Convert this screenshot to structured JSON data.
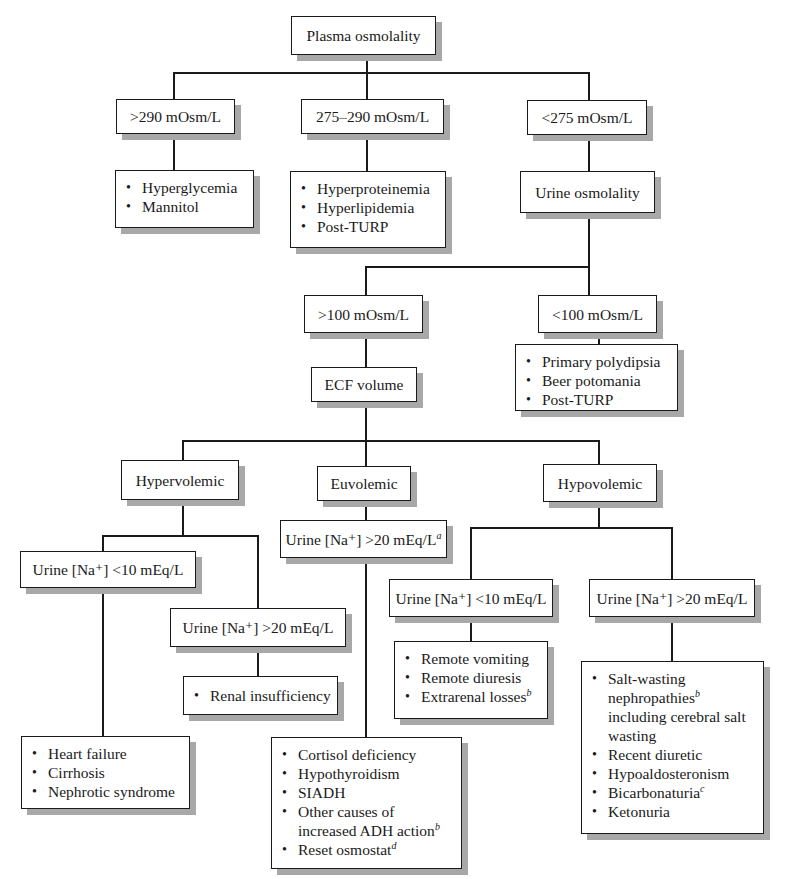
{
  "nodes": {
    "plasma_osmolality": "Plasma osmolality",
    "gt290": ">290 mOsm/L",
    "range275_290": "275–290 mOsm/L",
    "lt275": "<275 mOsm/L",
    "hyperglycemia_list": [
      "Hyperglycemia",
      "Mannitol"
    ],
    "hyperproteinemia_list": [
      "Hyperproteinemia",
      "Hyperlipidemia",
      "Post-TURP"
    ],
    "urine_osmolality": "Urine osmolality",
    "gt100": ">100 mOsm/L",
    "lt100": "<100 mOsm/L",
    "lt100_list": [
      "Primary polydipsia",
      "Beer potomania",
      "Post-TURP"
    ],
    "ecf_volume": "ECF volume",
    "hypervolemic": "Hypervolemic",
    "euvolemic": "Euvolemic",
    "hypovolemic": "Hypovolemic",
    "hyper_una_lt10": "Urine [Na⁺] <10 mEq/L",
    "hyper_una_gt20": "Urine [Na⁺] >20 mEq/L",
    "eu_una_gt20": {
      "text": "Urine [Na⁺] >20 mEq/L",
      "sup": "a"
    },
    "hypo_una_lt10": "Urine [Na⁺] <10 mEq/L",
    "hypo_una_gt20": "Urine [Na⁺] >20 mEq/L",
    "renal_list": [
      "Renal insufficiency"
    ],
    "heart_failure_list": [
      "Heart failure",
      "Cirrhosis",
      "Nephrotic syndrome"
    ],
    "euvolemic_list": [
      {
        "text": "Cortisol deficiency",
        "sup": ""
      },
      {
        "text": "Hypothyroidism",
        "sup": ""
      },
      {
        "text": "SIADH",
        "sup": ""
      },
      {
        "text": "Other causes of",
        "line2": "increased ADH action",
        "sup": "b"
      },
      {
        "text": "Reset osmostat",
        "sup": "d"
      }
    ],
    "hypo_lt10_list": [
      {
        "text": "Remote vomiting",
        "sup": ""
      },
      {
        "text": "Remote diuresis",
        "sup": ""
      },
      {
        "text": "Extrarenal losses",
        "sup": "b"
      }
    ],
    "hypo_gt20_list": [
      {
        "text": "Salt-wasting",
        "line2": "nephropathies",
        "sup2": "b",
        "line3": "including cerebral salt",
        "line4": "wasting"
      },
      {
        "text": "Recent diuretic",
        "sup": ""
      },
      {
        "text": "Hypoaldosteronism",
        "sup": ""
      },
      {
        "text": "Bicarbonaturia",
        "sup": "c"
      },
      {
        "text": "Ketonuria",
        "sup": ""
      }
    ]
  },
  "colors": {
    "line": "#1a1a1a",
    "shadow": "#a8a8a8",
    "background": "#ffffff"
  }
}
